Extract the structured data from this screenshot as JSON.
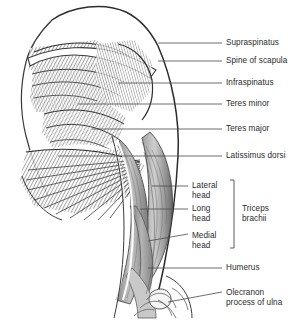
{
  "figure": {
    "background_color": "#ffffff",
    "text_color": "#2b2b2b",
    "line_color": "#4a4a4a"
  },
  "labels": [
    {
      "name": "supraspinatus",
      "text": "Supraspinatus",
      "x": 226,
      "y": 38,
      "leader": {
        "x1": 158,
        "y1": 43,
        "x2": 222,
        "y2": 43
      }
    },
    {
      "name": "spine-of-scapula",
      "text": "Spine of scapula",
      "x": 226,
      "y": 56,
      "leader": {
        "x1": 158,
        "y1": 61,
        "x2": 222,
        "y2": 61
      }
    },
    {
      "name": "infraspinatus",
      "text": "Infraspinatus",
      "x": 226,
      "y": 78,
      "leader": {
        "x1": 118,
        "y1": 83,
        "x2": 222,
        "y2": 83
      }
    },
    {
      "name": "teres-minor",
      "text": "Teres minor",
      "x": 226,
      "y": 99,
      "leader": {
        "x1": 78,
        "y1": 104,
        "x2": 222,
        "y2": 104
      }
    },
    {
      "name": "teres-major",
      "text": "Teres major",
      "x": 226,
      "y": 124,
      "leader": {
        "x1": 92,
        "y1": 129,
        "x2": 222,
        "y2": 129
      }
    },
    {
      "name": "latissimus-dorsi",
      "text": "Latissimus dorsi",
      "x": 226,
      "y": 151,
      "leader": {
        "x1": 58,
        "y1": 156,
        "x2": 222,
        "y2": 156
      }
    },
    {
      "name": "lateral-head",
      "text": "Lateral\nhead",
      "x": 192,
      "y": 181,
      "two_line": true,
      "leader": {
        "x1": 152,
        "y1": 186,
        "x2": 188,
        "y2": 186
      }
    },
    {
      "name": "long-head",
      "text": "Long\nhead",
      "x": 192,
      "y": 204,
      "two_line": true,
      "leader": {
        "x1": 140,
        "y1": 209,
        "x2": 188,
        "y2": 209
      }
    },
    {
      "name": "medial-head",
      "text": "Medial\nhead",
      "x": 192,
      "y": 231,
      "two_line": true,
      "leader": {
        "x1": 148,
        "y1": 241,
        "x2": 188,
        "y2": 234
      }
    },
    {
      "name": "triceps-brachii",
      "text": "Triceps\nbrachii",
      "x": 242,
      "y": 204,
      "two_line": true
    },
    {
      "name": "humerus",
      "text": "Humerus",
      "x": 226,
      "y": 263,
      "leader": {
        "x1": 148,
        "y1": 268,
        "x2": 222,
        "y2": 268
      }
    },
    {
      "name": "olecranon-process",
      "text": "Olecranon\nprocess of ulna",
      "x": 226,
      "y": 288,
      "two_line": true,
      "leader": {
        "x1": 168,
        "y1": 302,
        "x2": 222,
        "y2": 292
      }
    }
  ],
  "bracket": {
    "name": "triceps-bracket",
    "x": 234,
    "y_top": 180,
    "y_bottom": 248,
    "tick": 4
  }
}
